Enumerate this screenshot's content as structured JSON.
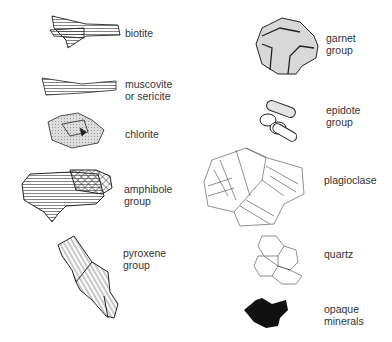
{
  "diagram": {
    "minerals": [
      {
        "id": "biotite",
        "label": "biotite",
        "column": "left"
      },
      {
        "id": "muscovite",
        "label_line1": "muscovite",
        "label_line2": "or sericite",
        "column": "left"
      },
      {
        "id": "chlorite",
        "label": "chlorite",
        "column": "left"
      },
      {
        "id": "amphibole",
        "label_line1": "amphibole",
        "label_line2": "group",
        "column": "left"
      },
      {
        "id": "pyroxene",
        "label_line1": "pyroxene",
        "label_line2": "group",
        "column": "left"
      },
      {
        "id": "garnet",
        "label_line1": "garnet",
        "label_line2": "group",
        "column": "right"
      },
      {
        "id": "epidote",
        "label_line1": "epidote",
        "label_line2": "group",
        "column": "right"
      },
      {
        "id": "plagioclase",
        "label": "plagioclase",
        "column": "right"
      },
      {
        "id": "quartz",
        "label": "quartz",
        "column": "right"
      },
      {
        "id": "opaque",
        "label_line1": "opaque",
        "label_line2": "minerals",
        "column": "right"
      }
    ],
    "colors": {
      "line": "#222222",
      "fill_grey": "#d8d8d8",
      "opaque": "#111111",
      "text": "#333333"
    }
  }
}
